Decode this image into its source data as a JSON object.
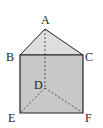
{
  "colors": {
    "face_fill": "#c8c8c8",
    "top_fill": "#dedede",
    "edge": "#222222",
    "hidden_edge": "#333333"
  },
  "vertices": {
    "A": {
      "label": "A",
      "x": 45,
      "y": 29
    },
    "B": {
      "label": "B",
      "x": 20,
      "y": 55
    },
    "C": {
      "label": "C",
      "x": 83,
      "y": 55
    },
    "D": {
      "label": "D",
      "x": 45,
      "y": 88
    },
    "E": {
      "label": "E",
      "x": 20,
      "y": 113
    },
    "F": {
      "label": "F",
      "x": 83,
      "y": 113
    }
  }
}
